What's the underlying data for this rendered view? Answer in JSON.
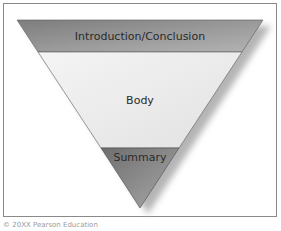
{
  "diagram": {
    "type": "inverted-pyramid",
    "sections": [
      {
        "label": "Introduction/Conclusion",
        "color": "#9a9a9a"
      },
      {
        "label": "Body",
        "color": "#ececec"
      },
      {
        "label": "Summary",
        "color": "#8c8c8c"
      }
    ],
    "border_color": "#8a8a8a",
    "shadow_color": "#b5b5b5"
  },
  "caption": "© 20XX Pearson Education"
}
